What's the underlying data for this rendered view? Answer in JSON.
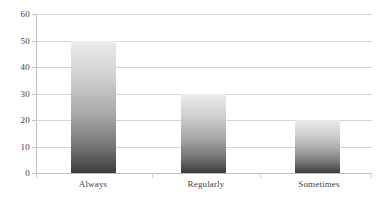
{
  "chart_data": {
    "type": "bar",
    "title": "",
    "subtitle": "",
    "xlabel": "",
    "ylabel": "",
    "categories": [
      "Always",
      "Regularly",
      "Sometimes"
    ],
    "values": [
      50,
      30,
      20
    ],
    "series": [
      {
        "name": "",
        "values": [
          50,
          30,
          20
        ]
      }
    ],
    "ylim": [
      0,
      60
    ],
    "y_ticks": [
      0,
      10,
      20,
      30,
      40,
      50,
      60
    ],
    "y_tick_labels": [
      "0",
      "10",
      "20",
      "30",
      "40",
      "50",
      "60"
    ],
    "grid": {
      "horizontal": true,
      "vertical": false,
      "color": "#d4d4d4"
    },
    "legend": {
      "visible": false,
      "position": "none",
      "entries": []
    },
    "annotations": [],
    "data_labels": {
      "visible": false
    },
    "colors": {
      "bar_gradient_top": "#ececec",
      "bar_gradient_bottom": "#3c3c3c",
      "gridline": "#d4d4d4",
      "axis_line": "#bdbdbd",
      "tick_label": "#3f3f3f",
      "background": "#ffffff"
    }
  }
}
